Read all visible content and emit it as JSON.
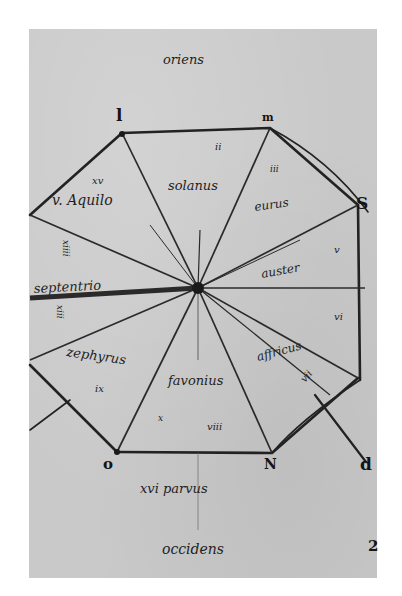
{
  "figure": {
    "type": "medieval wind diagram (rose of winds), manuscript facsimile",
    "colors": {
      "paper": "#c9c9c9",
      "ink": "#1e1e1e",
      "background": "#ffffff"
    }
  },
  "cardinal_labels": {
    "top": "oriens",
    "bottom": "occidens"
  },
  "vertex_letters": {
    "top_left": "l",
    "top_right": "m",
    "right_upper": "S",
    "bottom_left": "o",
    "bottom_right": "N",
    "far_right_lower": "d",
    "margin_bottom_right": "2"
  },
  "sector_labels": {
    "top": "solanus",
    "top_numeral": "ii",
    "upper_left_numeral": "xv",
    "upper_left": "v. Aquilo",
    "upper_right": "eurus",
    "upper_right_numeral": "iii",
    "left_vertical_upper": "xiiii",
    "left": "septentrio",
    "left_vertical_lower": "xiii",
    "right": "auster",
    "right_numeral_upper": "v",
    "right_numeral_lower": "vi",
    "lower_left": "zephyrus",
    "lower_left_numeral": "ix",
    "lower_right": "affricus",
    "lower_right_numeral": "vii",
    "bottom": "favonius",
    "bottom_numeral": "x",
    "bottom_sub": "viii",
    "bottom_edge": "xvi  parvus"
  }
}
